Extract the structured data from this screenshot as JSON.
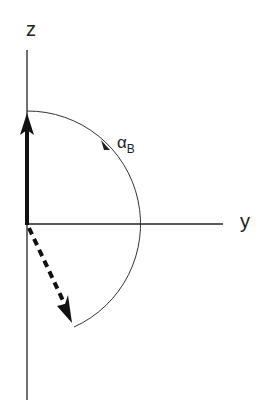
{
  "diagram": {
    "axes": {
      "z_label": "z",
      "y_label": "y"
    },
    "angle": {
      "symbol": "α",
      "subscript": "B"
    },
    "vectors": [
      {
        "name": "initial",
        "style": "solid",
        "direction": "+z"
      },
      {
        "name": "rotated",
        "style": "dashed",
        "direction": "rotated by alpha_B"
      }
    ],
    "colors": {
      "background": "#ffffff",
      "lines": "#111111",
      "arc": "#333333"
    }
  }
}
